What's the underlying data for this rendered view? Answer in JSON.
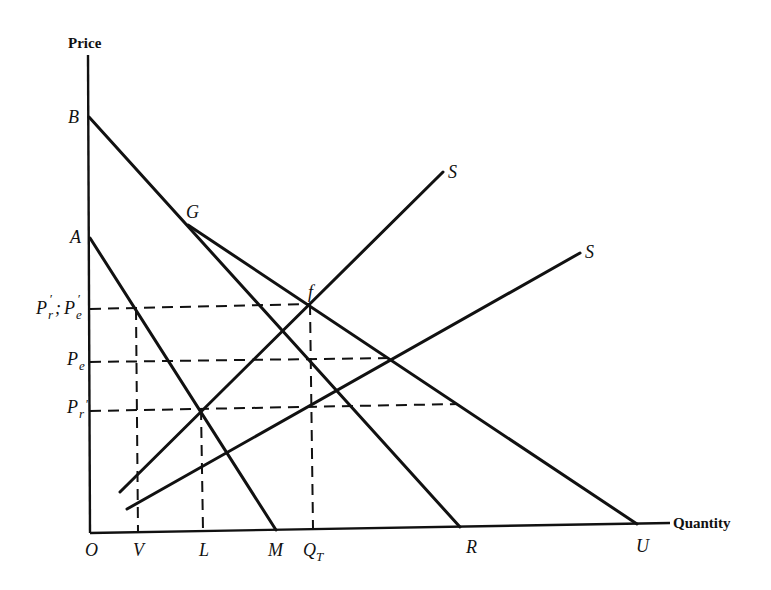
{
  "diagram": {
    "axes": {
      "y_title": "Price",
      "x_title": "Quantity",
      "origin_label": "O"
    },
    "y_labels": {
      "B": "B",
      "A": "A",
      "Pr_prime_Pe_prime": {
        "main": "P",
        "sub1": "r",
        "prime1": "′",
        "sep": "; ",
        "main2": "P",
        "sub2": "e",
        "prime2": "′"
      },
      "Pe": {
        "main": "P",
        "sub": "e"
      },
      "Pr": {
        "main": "P",
        "sub": "r",
        "prime": "'"
      }
    },
    "x_labels": {
      "V": "V",
      "L": "L",
      "M": "M",
      "QT": {
        "main": "Q",
        "sub": "T"
      },
      "R": "R",
      "U": "U"
    },
    "point_labels": {
      "G": "G",
      "f": "f",
      "S_upper": "S",
      "S_lower": "S"
    },
    "lines": [
      {
        "name": "demand-AM",
        "from": "A",
        "to": "M"
      },
      {
        "name": "demand-BR",
        "from": "B",
        "to": "R"
      },
      {
        "name": "demand-GU",
        "from": "G",
        "to": "U"
      },
      {
        "name": "supply-upper",
        "label": "S"
      },
      {
        "name": "supply-lower",
        "label": "S"
      }
    ]
  }
}
